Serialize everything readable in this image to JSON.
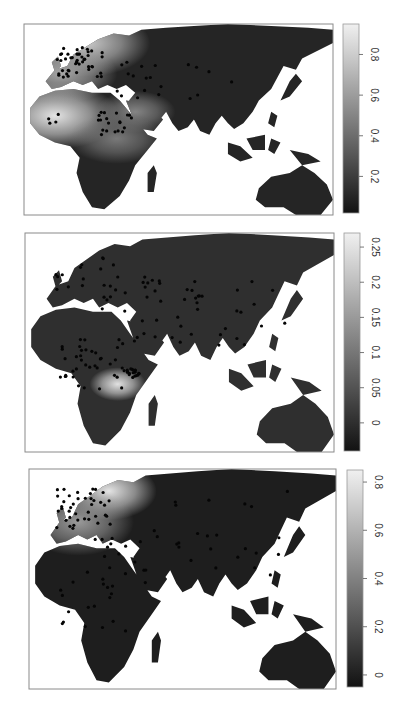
{
  "figure": {
    "orientation": "rotated-90"
  },
  "chart_data": [
    {
      "type": "heatmap",
      "panel": 1,
      "title": "",
      "region": "Afro-Eurasia and Australia",
      "colormap": "grayscale (dark = low, light = high)",
      "colorbar": {
        "range": [
          0.02,
          0.95
        ],
        "ticks": [
          0.2,
          0.4,
          0.6,
          0.8
        ],
        "tick_labels": [
          "0.2",
          "0.4",
          "0.6",
          "0.8"
        ]
      },
      "hotspots": [
        {
          "location": "West Africa / Sahel",
          "value": 0.9
        },
        {
          "location": "Northern Europe / Scandinavia",
          "value": 0.8
        },
        {
          "location": "Western Europe",
          "value": 0.65
        },
        {
          "location": "Arabian Peninsula",
          "value": 0.5
        },
        {
          "location": "East Africa",
          "value": 0.45
        }
      ],
      "background_value": 0.1,
      "points": "sample sites concentrated in Europe, North & East Africa, Middle East; sparse across Asia"
    },
    {
      "type": "heatmap",
      "panel": 2,
      "title": "",
      "region": "Afro-Eurasia and Australia",
      "colormap": "grayscale (dark = low, light = high)",
      "colorbar": {
        "range": [
          -0.04,
          0.27
        ],
        "ticks": [
          0,
          0.05,
          0.1,
          0.15,
          0.2,
          0.25
        ],
        "tick_labels": [
          "0",
          "0.05",
          "0.1",
          "0.15",
          "0.2",
          "0.25"
        ]
      },
      "hotspots": [
        {
          "location": "East Africa (Great Lakes / Kenya-Tanzania)",
          "value": 0.25
        }
      ],
      "background_value": 0.0,
      "points": "sample sites spread across Africa, Europe and Asia with a cluster in East Africa"
    },
    {
      "type": "heatmap",
      "panel": 3,
      "title": "",
      "region": "Afro-Eurasia and Australia",
      "colormap": "grayscale (dark = low, light = high)",
      "colorbar": {
        "range": [
          -0.05,
          0.85
        ],
        "ticks": [
          0,
          0.2,
          0.4,
          0.6,
          0.8
        ],
        "tick_labels": [
          "0",
          "0.2",
          "0.4",
          "0.6",
          "0.8"
        ]
      },
      "hotspots": [
        {
          "location": "Scandinavia / Baltic",
          "value": 0.8
        },
        {
          "location": "Northwestern Europe",
          "value": 0.5
        }
      ],
      "background_value": 0.0,
      "points": "sample sites concentrated in Europe, scattered across Africa and Asia"
    }
  ]
}
